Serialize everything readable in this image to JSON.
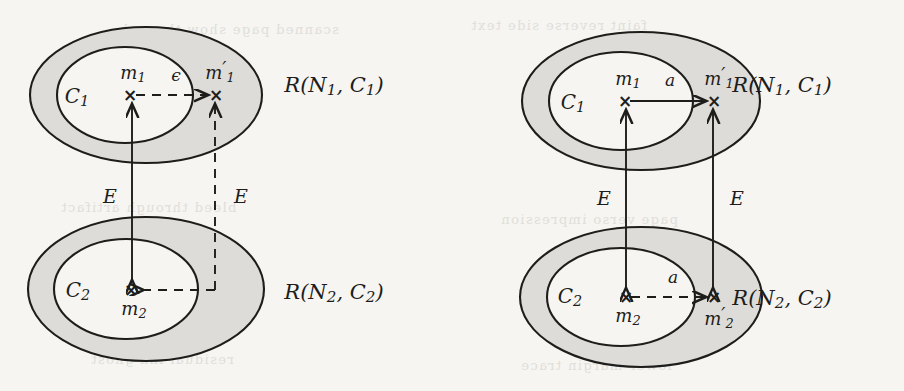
{
  "figure": {
    "type": "diagram",
    "background_color": "#f6f5f2",
    "ink_color": "#1d1d1b",
    "annulus_fill": "#dedcd8",
    "inner_fill": "#f6f5f2"
  },
  "panels": [
    {
      "id": "left",
      "regions": [
        {
          "id": "top",
          "inner_label": "C",
          "inner_sub": "1",
          "region_label": "R(N",
          "region_sub1": "1",
          "region_mid": ", C",
          "region_sub2": "1",
          "region_close": ")",
          "region_label_full": "R(N1, C1)",
          "points": [
            {
              "name": "m1",
              "base": "m",
              "sub": "1",
              "prime": "",
              "marker": "×"
            },
            {
              "name": "m1p",
              "base": "m",
              "sub": "1",
              "prime": "′",
              "marker": "×"
            }
          ],
          "horizontal_edge": {
            "label": "ϵ",
            "style": "dashed",
            "direction": "right",
            "from": "m1",
            "to": "m1p"
          }
        },
        {
          "id": "bottom",
          "inner_label": "C",
          "inner_sub": "2",
          "region_label": "R(N",
          "region_sub1": "2",
          "region_mid": ", C",
          "region_sub2": "2",
          "region_close": ")",
          "region_label_full": "R(N2, C2)",
          "points": [
            {
              "name": "m2",
              "base": "m",
              "sub": "2",
              "prime": "",
              "marker": "×"
            }
          ],
          "horizontal_edge": {
            "label": "",
            "style": "dashed",
            "direction": "left",
            "from": "dashed-vertical",
            "to": "m2"
          }
        }
      ],
      "vertical_edges": [
        {
          "id": "left-E",
          "label": "E",
          "style": "solid",
          "arrows": "both"
        },
        {
          "id": "right-E",
          "label": "E",
          "style": "dashed",
          "arrows": "up"
        }
      ]
    },
    {
      "id": "right",
      "regions": [
        {
          "id": "top",
          "inner_label": "C",
          "inner_sub": "1",
          "region_label": "R(N",
          "region_sub1": "1",
          "region_mid": ", C",
          "region_sub2": "1",
          "region_close": ")",
          "region_label_full": "R(N1, C1)",
          "points": [
            {
              "name": "m1",
              "base": "m",
              "sub": "1",
              "prime": "",
              "marker": "×"
            },
            {
              "name": "m1p",
              "base": "m",
              "sub": "1",
              "prime": "′",
              "marker": "×"
            }
          ],
          "horizontal_edge": {
            "label": "a",
            "style": "solid",
            "direction": "right",
            "from": "m1",
            "to": "m1p"
          }
        },
        {
          "id": "bottom",
          "inner_label": "C",
          "inner_sub": "2",
          "region_label": "R(N",
          "region_sub1": "2",
          "region_mid": ", C",
          "region_sub2": "2",
          "region_close": ")",
          "region_label_full": "R(N2, C2)",
          "points": [
            {
              "name": "m2",
              "base": "m",
              "sub": "2",
              "prime": "",
              "marker": "×"
            },
            {
              "name": "m2p",
              "base": "m",
              "sub": "2",
              "prime": "′",
              "marker": "×"
            }
          ],
          "horizontal_edge": {
            "label": "a",
            "style": "dashed",
            "direction": "right",
            "from": "m2",
            "to": "m2p"
          }
        }
      ],
      "vertical_edges": [
        {
          "id": "left-E",
          "label": "E",
          "style": "solid",
          "arrows": "both"
        },
        {
          "id": "right-E",
          "label": "E",
          "style": "solid",
          "arrows": "both"
        }
      ]
    }
  ],
  "ghost_text": [
    {
      "text": "scanned page show-through",
      "x": 118,
      "y": 22
    },
    {
      "text": "faint reverse side text",
      "x": 470,
      "y": 18
    },
    {
      "text": "bleed through artifact",
      "x": 60,
      "y": 200
    },
    {
      "text": "page verso impression",
      "x": 500,
      "y": 212
    },
    {
      "text": "residual ink ghost",
      "x": 90,
      "y": 352
    },
    {
      "text": "lower margin trace",
      "x": 520,
      "y": 358
    }
  ]
}
